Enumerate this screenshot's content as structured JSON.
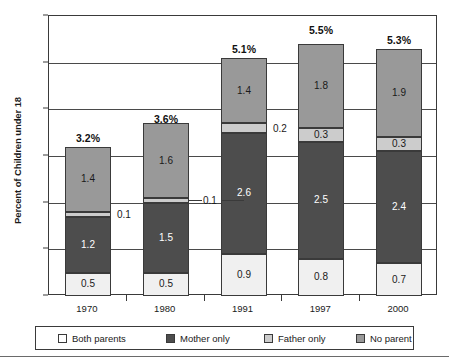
{
  "chart_data": {
    "type": "bar",
    "subtype": "stacked-bar",
    "title": "",
    "xlabel": "",
    "ylabel": "Percent of Children under 18",
    "categories": [
      "1970",
      "1980",
      "1991",
      "1997",
      "2000"
    ],
    "ylim": [
      0.0,
      6.0
    ],
    "ytick_step": 1.0,
    "ytick_labels": [
      "0.0",
      "1.0",
      "2.0",
      "3.0",
      "4.0",
      "5.0",
      "6.0"
    ],
    "grid": true,
    "grid_axis": "y",
    "legend_position": "bottom",
    "series": [
      {
        "name": "Both parents",
        "color": "#f0f0f0",
        "legend_swatch_color": "#ffffff",
        "values": [
          0.5,
          0.5,
          0.9,
          0.8,
          0.7
        ],
        "value_labels": [
          "0.5",
          "0.5",
          "0.9",
          "0.8",
          "0.7"
        ],
        "label_placement": [
          "inside",
          "inside",
          "inside",
          "inside",
          "inside"
        ]
      },
      {
        "name": "Mother only",
        "color": "#4d4d4d",
        "legend_swatch_color": "#4d4d4d",
        "values": [
          1.2,
          1.5,
          2.6,
          2.5,
          2.4
        ],
        "value_labels": [
          "1.2",
          "1.5",
          "2.6",
          "2.5",
          "2.4"
        ],
        "label_placement": [
          "inside",
          "inside",
          "inside",
          "inside",
          "inside"
        ]
      },
      {
        "name": "Father only",
        "color": "#cccccc",
        "legend_swatch_color": "#cccccc",
        "values": [
          0.1,
          0.1,
          0.2,
          0.3,
          0.3
        ],
        "value_labels": [
          "0.1",
          "0.1",
          "0.2",
          "0.3",
          "0.3"
        ],
        "label_placement": [
          "outside-right",
          "outside-right-leader",
          "outside-right",
          "inside",
          "inside"
        ]
      },
      {
        "name": "No parent",
        "color": "#999999",
        "legend_swatch_color": "#999999",
        "values": [
          1.4,
          1.6,
          1.4,
          1.8,
          1.9
        ],
        "value_labels": [
          "1.4",
          "1.6",
          "1.4",
          "1.8",
          "1.9"
        ],
        "label_placement": [
          "inside",
          "inside",
          "inside",
          "inside",
          "inside"
        ]
      }
    ],
    "totals": [
      3.2,
      3.6,
      5.1,
      5.5,
      5.3
    ],
    "total_labels": [
      "3.2%",
      "3.6%",
      "5.1%",
      "5.5%",
      "5.3%"
    ],
    "callouts": [
      {
        "text": "0.1",
        "category": "1970",
        "series": "Father only"
      },
      {
        "text": "0.1",
        "category": "1980",
        "series": "Father only"
      },
      {
        "text": "0.2",
        "category": "1991",
        "series": "Father only"
      }
    ]
  },
  "legend": {
    "items": [
      {
        "label": "Both parents",
        "swatch": "sw-both"
      },
      {
        "label": "Mother only",
        "swatch": "sw-mother"
      },
      {
        "label": "Father only",
        "swatch": "sw-father"
      },
      {
        "label": "No parent",
        "swatch": "sw-nopar"
      }
    ]
  }
}
